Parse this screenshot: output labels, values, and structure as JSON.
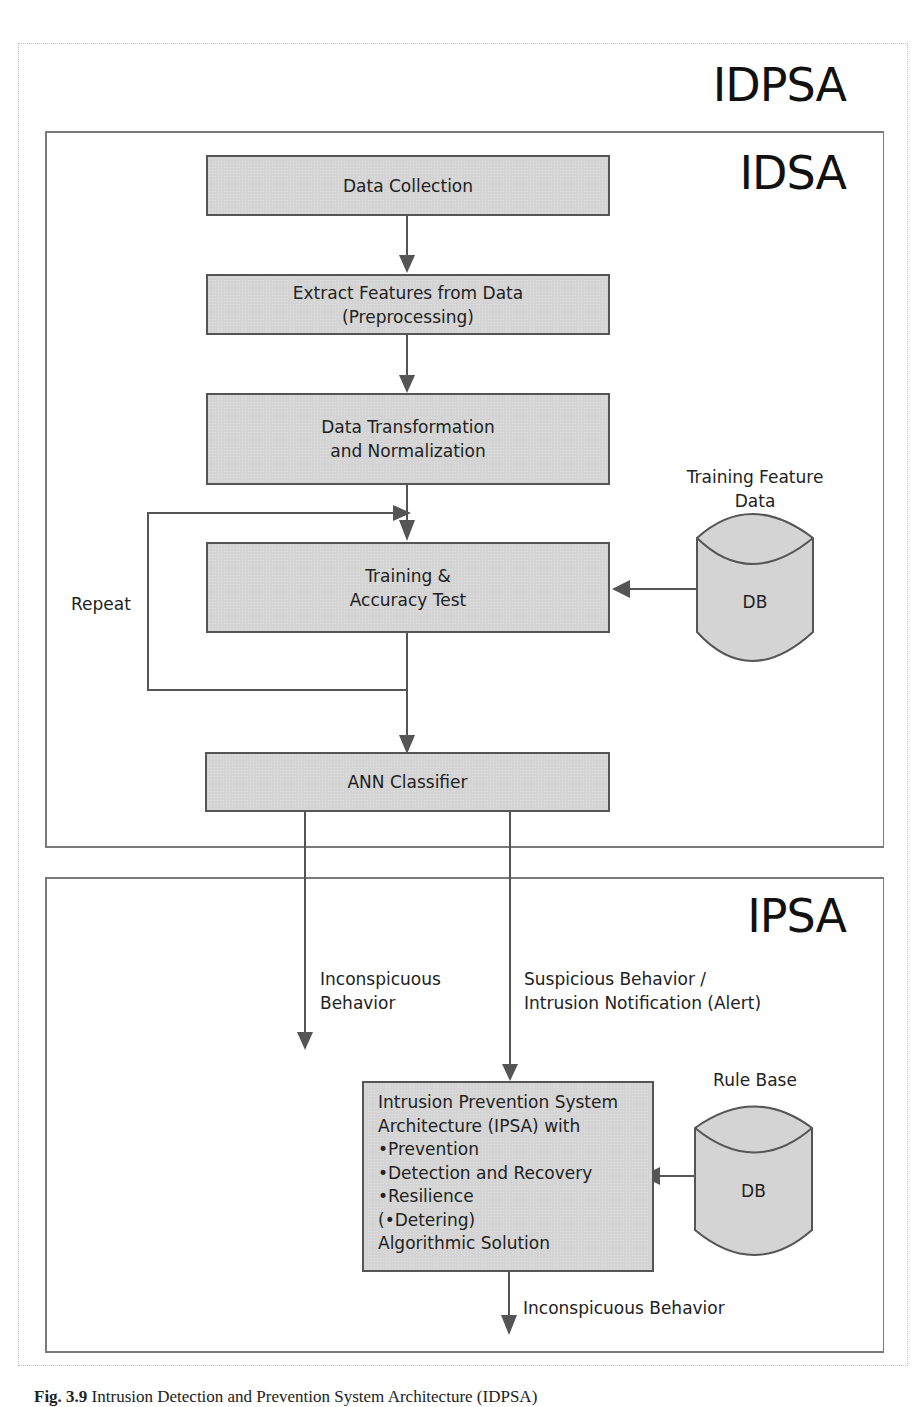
{
  "outer_frame": {
    "title": "IDPSA"
  },
  "idsa_frame": {
    "title": "IDSA",
    "steps": [
      {
        "id": "data-collection",
        "lines": [
          "Data Collection"
        ]
      },
      {
        "id": "extract-features",
        "lines": [
          "Extract Features from Data",
          "(Preprocessing)"
        ]
      },
      {
        "id": "data-transformation",
        "lines": [
          "Data Transformation",
          "and Normalization"
        ]
      },
      {
        "id": "training-accuracy",
        "lines": [
          "Training &",
          "Accuracy Test"
        ]
      },
      {
        "id": "ann-classifier",
        "lines": [
          "ANN Classifier"
        ]
      }
    ],
    "loop_label": "Repeat",
    "training_db": {
      "caption_lines": [
        "Training Feature",
        "Data"
      ],
      "label": "DB"
    }
  },
  "ipsa_frame": {
    "title": "IPSA",
    "branch_left_label": [
      "Inconspicuous",
      "Behavior"
    ],
    "branch_right_label": [
      "Suspicious Behavior /",
      "Intrusion Notification (Alert)"
    ],
    "ipsa_box_lines": [
      "Intrusion Prevention System",
      "Architecture (IPSA) with",
      "•Prevention",
      "•Detection and Recovery",
      "•Resilience",
      "(•Detering)",
      "Algorithmic Solution"
    ],
    "rule_db": {
      "caption": "Rule Base",
      "label": "DB"
    },
    "output_label": "Inconspicuous Behavior"
  },
  "caption": {
    "prefix": "Fig. 3.9",
    "text": "Intrusion Detection and Prevention System Architecture (IDPSA)"
  },
  "colors": {
    "box_fill": "#d4d4d4",
    "box_border": "#555555",
    "arrow": "#555555",
    "frame_border": "#7a7a7a",
    "outer_border": "#bdbdbd"
  }
}
